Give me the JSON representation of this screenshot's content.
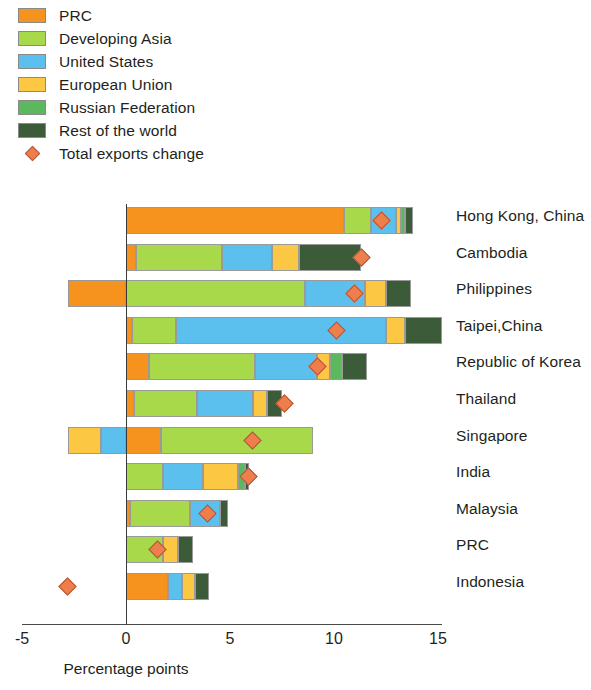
{
  "legend": {
    "items": [
      {
        "label": "PRC",
        "color": "#f6931e"
      },
      {
        "label": "Developing Asia",
        "color": "#a8d94a"
      },
      {
        "label": "United States",
        "color": "#5bc0ee"
      },
      {
        "label": "European Union",
        "color": "#fcc843"
      },
      {
        "label": "Russian Federation",
        "color": "#5cb85c"
      },
      {
        "label": "Rest of the world",
        "color": "#3c5b39"
      }
    ],
    "marker": {
      "label": "Total exports change",
      "color": "#ee7f4d"
    }
  },
  "axis": {
    "title": "Percentage points",
    "ticks": [
      "-5",
      "0",
      "5",
      "10",
      "15"
    ]
  },
  "chart_data": {
    "type": "bar",
    "orientation": "horizontal",
    "stacked": true,
    "title": "",
    "xlabel": "Percentage points",
    "ylabel": "",
    "xlim": [
      -5,
      15
    ],
    "xticks": [
      -5,
      0,
      5,
      10,
      15
    ],
    "grid": false,
    "legend_position": "top-left",
    "categories": [
      "Hong Kong, China",
      "Cambodia",
      "Philippines",
      "Taipei,China",
      "Republic of Korea",
      "Thailand",
      "Singapore",
      "India",
      "Malaysia",
      "PRC",
      "Indonesia"
    ],
    "series": [
      {
        "name": "PRC",
        "color": "#f6931e",
        "values": [
          10.5,
          0.5,
          -2.8,
          0.3,
          1.1,
          0.4,
          1.7,
          0.0,
          0.2,
          0.0,
          2.0
        ]
      },
      {
        "name": "Developing Asia",
        "color": "#a8d94a",
        "values": [
          1.3,
          4.1,
          8.6,
          2.1,
          5.1,
          3.0,
          7.3,
          1.8,
          2.9,
          1.8,
          0.0
        ]
      },
      {
        "name": "United States",
        "color": "#5bc0ee",
        "values": [
          1.2,
          2.4,
          2.9,
          10.1,
          3.0,
          2.7,
          -1.2,
          1.9,
          1.4,
          0.0,
          0.7
        ]
      },
      {
        "name": "European Union",
        "color": "#fcc843",
        "values": [
          0.2,
          1.3,
          1.0,
          0.9,
          0.6,
          0.7,
          -1.6,
          1.7,
          0.0,
          0.7,
          0.6
        ]
      },
      {
        "name": "Russian Federation",
        "color": "#5cb85c",
        "values": [
          0.2,
          0.0,
          0.0,
          0.0,
          0.6,
          0.0,
          0.0,
          0.3,
          0.0,
          0.0,
          0.0
        ]
      },
      {
        "name": "Rest of the world",
        "color": "#3c5b39",
        "values": [
          0.4,
          3.0,
          1.2,
          1.8,
          1.2,
          0.7,
          0.0,
          0.2,
          0.4,
          0.7,
          0.7
        ]
      }
    ],
    "marker_series": {
      "name": "Total exports change",
      "color": "#ee7f4d",
      "values": [
        12.3,
        11.3,
        11.0,
        10.1,
        9.2,
        7.6,
        6.1,
        5.9,
        3.9,
        1.5,
        -2.8
      ]
    }
  }
}
